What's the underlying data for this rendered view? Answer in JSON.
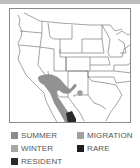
{
  "map": {
    "title": "Range map",
    "region": "Western North America",
    "colors": {
      "summer": "#8c8c8c",
      "winter": "#a6a6a6",
      "resident": "#2a2a2a",
      "migration": "#a0a0a0",
      "rare": "#1e1e1e",
      "borders": "#555555"
    }
  },
  "legend": {
    "items": [
      {
        "key": "summer",
        "label": "SUMMER",
        "color": "#8c8c8c"
      },
      {
        "key": "winter",
        "label": "WINTER",
        "color": "#a6a6a6"
      },
      {
        "key": "resident",
        "label": "RESIDENT",
        "color": "#2a2a2a"
      },
      {
        "key": "migration",
        "label": "MIGRATION",
        "color": "#a0a0a0"
      },
      {
        "key": "rare",
        "label": "RARE",
        "color": "#1e1e1e"
      }
    ]
  }
}
